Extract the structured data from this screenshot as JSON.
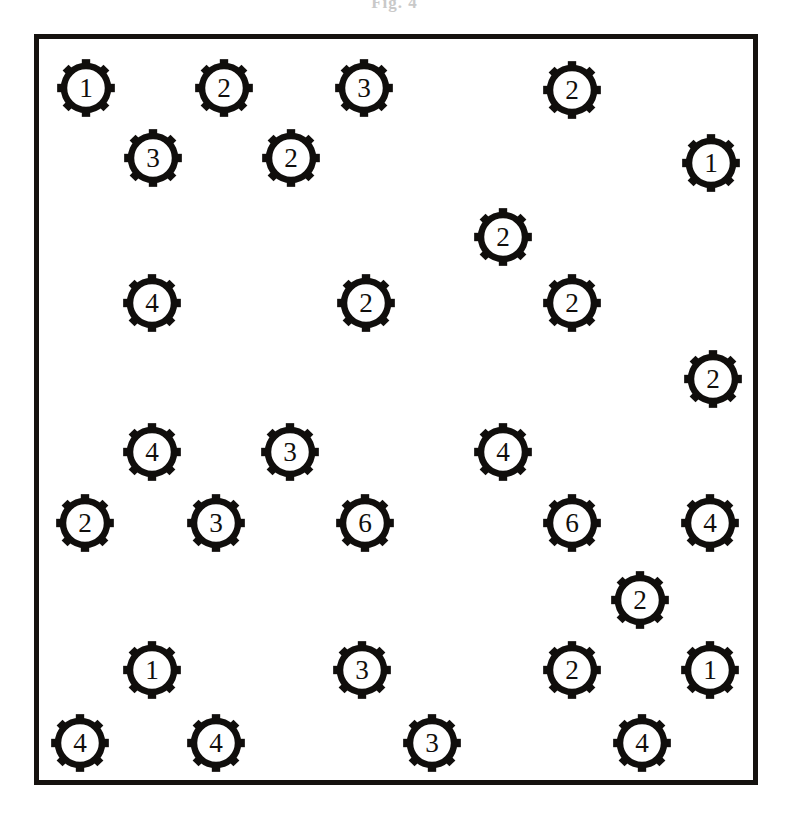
{
  "figure": {
    "caption_fragment": "Fig. 4",
    "frame": {
      "x": 34,
      "y": 34,
      "width": 724,
      "height": 751,
      "border_color": "#15120f",
      "border_width": 5,
      "background": "#ffffff"
    },
    "icon": {
      "name": "gear-icon",
      "shape": "cog-ring-with-8-teeth",
      "stroke_color": "#100e0c",
      "fill_color": "#ffffff",
      "label_color": "#100e0c"
    },
    "counts": {
      "total_icons": 30,
      "value_1": 4,
      "value_2": 11,
      "value_3": 7,
      "value_4": 8,
      "value_6": 2
    },
    "icons": [
      {
        "id": 1,
        "label": "1",
        "x": 86,
        "y": 88,
        "size": 62
      },
      {
        "id": 2,
        "label": "2",
        "x": 224,
        "y": 88,
        "size": 62
      },
      {
        "id": 3,
        "label": "3",
        "x": 364,
        "y": 88,
        "size": 62
      },
      {
        "id": 4,
        "label": "2",
        "x": 572,
        "y": 90,
        "size": 62
      },
      {
        "id": 5,
        "label": "3",
        "x": 153,
        "y": 158,
        "size": 62
      },
      {
        "id": 6,
        "label": "2",
        "x": 291,
        "y": 158,
        "size": 62
      },
      {
        "id": 7,
        "label": "1",
        "x": 711,
        "y": 163,
        "size": 62
      },
      {
        "id": 8,
        "label": "2",
        "x": 503,
        "y": 237,
        "size": 62
      },
      {
        "id": 9,
        "label": "4",
        "x": 152,
        "y": 303,
        "size": 62
      },
      {
        "id": 10,
        "label": "2",
        "x": 366,
        "y": 303,
        "size": 62
      },
      {
        "id": 11,
        "label": "2",
        "x": 572,
        "y": 303,
        "size": 62
      },
      {
        "id": 12,
        "label": "2",
        "x": 713,
        "y": 379,
        "size": 62
      },
      {
        "id": 13,
        "label": "4",
        "x": 152,
        "y": 452,
        "size": 62
      },
      {
        "id": 14,
        "label": "3",
        "x": 290,
        "y": 452,
        "size": 62
      },
      {
        "id": 15,
        "label": "4",
        "x": 503,
        "y": 452,
        "size": 62
      },
      {
        "id": 16,
        "label": "2",
        "x": 85,
        "y": 523,
        "size": 62
      },
      {
        "id": 17,
        "label": "3",
        "x": 216,
        "y": 523,
        "size": 62
      },
      {
        "id": 18,
        "label": "6",
        "x": 365,
        "y": 523,
        "size": 62
      },
      {
        "id": 19,
        "label": "6",
        "x": 572,
        "y": 523,
        "size": 62
      },
      {
        "id": 20,
        "label": "4",
        "x": 710,
        "y": 523,
        "size": 62
      },
      {
        "id": 21,
        "label": "2",
        "x": 640,
        "y": 600,
        "size": 62
      },
      {
        "id": 22,
        "label": "1",
        "x": 152,
        "y": 670,
        "size": 62
      },
      {
        "id": 23,
        "label": "3",
        "x": 362,
        "y": 670,
        "size": 62
      },
      {
        "id": 24,
        "label": "2",
        "x": 572,
        "y": 670,
        "size": 62
      },
      {
        "id": 25,
        "label": "1",
        "x": 710,
        "y": 670,
        "size": 62
      },
      {
        "id": 26,
        "label": "4",
        "x": 80,
        "y": 743,
        "size": 62
      },
      {
        "id": 27,
        "label": "4",
        "x": 216,
        "y": 743,
        "size": 62
      },
      {
        "id": 28,
        "label": "3",
        "x": 432,
        "y": 743,
        "size": 62
      },
      {
        "id": 29,
        "label": "4",
        "x": 642,
        "y": 743,
        "size": 62
      }
    ]
  }
}
